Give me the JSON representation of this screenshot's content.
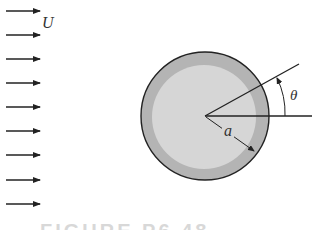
{
  "diagram": {
    "flow_label": "U",
    "radius_label": "a",
    "angle_label": "θ",
    "caption": "FIGURE P6.48",
    "colors": {
      "outer_ring": "#b4b4b4",
      "inner_fill": "#d6d6d6",
      "stroke": "#222222",
      "arrow": "#222222"
    },
    "arrows_count": 9
  }
}
